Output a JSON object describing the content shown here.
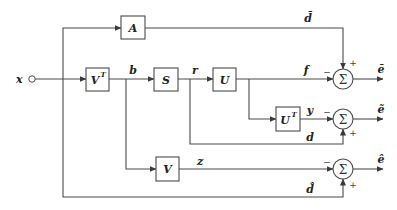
{
  "input": {
    "label": "x"
  },
  "blocks": {
    "A": {
      "label": "A"
    },
    "VT": {
      "label": "V",
      "sup": "T"
    },
    "S": {
      "label": "S"
    },
    "U": {
      "label": "U"
    },
    "UT": {
      "label": "U",
      "sup": "T"
    },
    "V": {
      "label": "V"
    }
  },
  "signals": {
    "b": "b",
    "r": "r",
    "f": "f",
    "y": "y",
    "z": "z",
    "d_bar": "d̄",
    "d": "d",
    "d_hat": "d̂"
  },
  "summers": [
    {
      "symbol": "Σ",
      "minus": "−",
      "plus": "+",
      "output": "ē"
    },
    {
      "symbol": "Σ",
      "minus": "−",
      "plus": "+",
      "output": "ẽ"
    },
    {
      "symbol": "Σ",
      "minus": "−",
      "plus": "+",
      "output": "ê"
    }
  ],
  "colors": {
    "line": "#4a4a4a",
    "text": "#222222",
    "background": "#ffffff"
  }
}
